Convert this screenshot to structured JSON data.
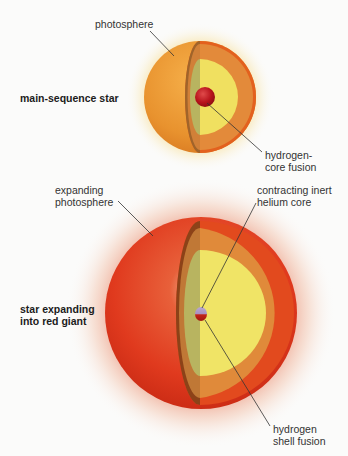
{
  "diagram": {
    "main_sequence": {
      "title": "main-sequence star",
      "labels": {
        "photosphere": "photosphere",
        "core_line1": "hydrogen-",
        "core_line2": "core fusion"
      }
    },
    "red_giant": {
      "title_line1": "star expanding",
      "title_line2": "into red giant",
      "labels": {
        "photosphere_line1": "expanding",
        "photosphere_line2": "photosphere",
        "core_line1": "contracting inert",
        "core_line2": "helium core",
        "shell_line1": "hydrogen",
        "shell_line2": "shell fusion"
      }
    },
    "colors": {
      "background": "#fbfbfa",
      "main_sequence_surface": "#e8922e",
      "red_giant_surface": "#e03a1e",
      "interior_shell": "#e08a3a",
      "interior_yellow": "#f0e060",
      "interior_green": "#b8b860",
      "core_red": "#b8141c",
      "leader_line": "#333333"
    }
  }
}
